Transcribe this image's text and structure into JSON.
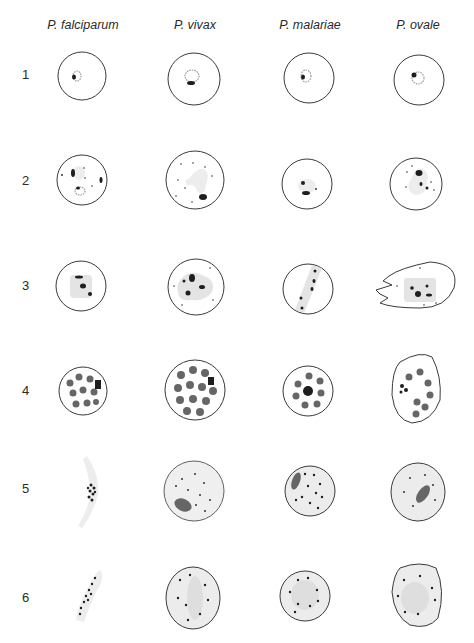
{
  "figure": {
    "columns": [
      {
        "label": "P. falciparum",
        "x": 83
      },
      {
        "label": "P. vivax",
        "x": 195
      },
      {
        "label": "P. malariae",
        "x": 310
      },
      {
        "label": "P. ovale",
        "x": 418
      }
    ],
    "rows": [
      {
        "label": "1",
        "y": 74,
        "stage": "young ring"
      },
      {
        "label": "2",
        "y": 180,
        "stage": "growing trophozoite"
      },
      {
        "label": "3",
        "y": 285,
        "stage": "mature trophozoite / early schizont"
      },
      {
        "label": "4",
        "y": 390,
        "stage": "mature schizont"
      },
      {
        "label": "5",
        "y": 488,
        "stage": "macrogametocyte"
      },
      {
        "label": "6",
        "y": 597,
        "stage": "microgametocyte"
      }
    ]
  }
}
